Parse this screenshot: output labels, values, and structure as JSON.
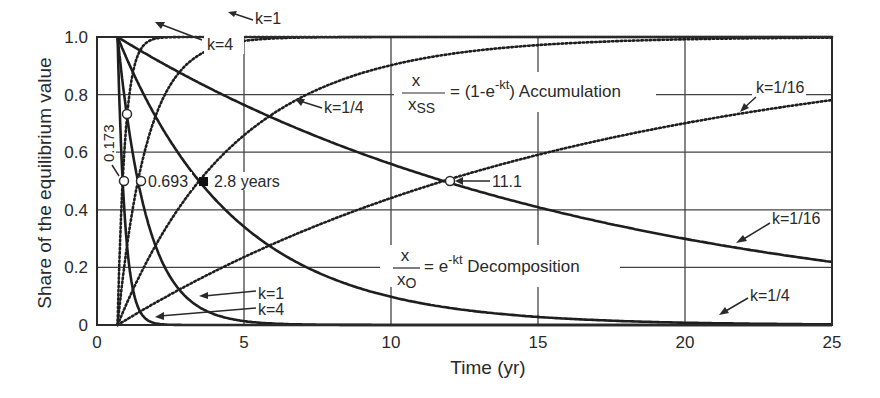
{
  "chart_data": {
    "type": "line",
    "title": "",
    "xlabel": "Time (yr)",
    "ylabel": "Share of the equilibrium value",
    "xlim": [
      0,
      25
    ],
    "ylim": [
      0,
      1.0
    ],
    "x_ticks": [
      "0",
      "5",
      "10",
      "15",
      "20",
      "25"
    ],
    "y_ticks": [
      "0",
      "0.2",
      "0.4",
      "0.6",
      "0.8",
      "1.0"
    ],
    "grid": true,
    "time_offset": 0.7,
    "series": [
      {
        "name": "Decomposition k=4",
        "group": "decomposition",
        "k": 4,
        "style": "solid"
      },
      {
        "name": "Decomposition k=1",
        "group": "decomposition",
        "k": 1,
        "style": "solid"
      },
      {
        "name": "Decomposition k=1/4",
        "group": "decomposition",
        "k": 0.25,
        "style": "solid"
      },
      {
        "name": "Decomposition k=1/16",
        "group": "decomposition",
        "k": 0.0625,
        "style": "solid"
      },
      {
        "name": "Accumulation k=4",
        "group": "accumulation",
        "k": 4,
        "style": "dotted"
      },
      {
        "name": "Accumulation k=1",
        "group": "accumulation",
        "k": 1,
        "style": "dotted"
      },
      {
        "name": "Accumulation k=1/4",
        "group": "accumulation",
        "k": 0.25,
        "style": "dotted"
      },
      {
        "name": "Accumulation k=1/16",
        "group": "accumulation",
        "k": 0.0625,
        "style": "dotted"
      }
    ],
    "half_life_points": [
      {
        "label": "0.173",
        "t": 0.173,
        "y": 0.5
      },
      {
        "label": "0.693",
        "t": 0.693,
        "y": 0.5
      },
      {
        "label": "2.8 years",
        "t": 2.8,
        "y": 0.5,
        "filled": true
      },
      {
        "label": "11.1",
        "t": 11.1,
        "y": 0.5
      }
    ],
    "annotations": {
      "accumulation_formula": {
        "num": "x",
        "den": "x",
        "den_sub": "SS",
        "rhs_pre": "= (1-e",
        "rhs_exp": "-kt",
        "rhs_post": ") Accumulation"
      },
      "decomposition_formula": {
        "num": "x",
        "den": "x",
        "den_sub": "O",
        "rhs_pre": "= e",
        "rhs_exp": "-kt",
        "rhs_post": " Decomposition"
      },
      "labels": [
        {
          "text": "k=1",
          "pos": "top accumulation"
        },
        {
          "text": "k=4",
          "pos": "top accumulation"
        },
        {
          "text": "k=1/4",
          "pos": "accumulation"
        },
        {
          "text": "k=1/16",
          "pos": "accumulation"
        },
        {
          "text": "k=1/16",
          "pos": "decomposition"
        },
        {
          "text": "k=1",
          "pos": "decomposition bottom"
        },
        {
          "text": "k=4",
          "pos": "decomposition bottom"
        },
        {
          "text": "k=1/4",
          "pos": "decomposition bottom right"
        }
      ]
    }
  },
  "labels": {
    "k1_top": "k=1",
    "k4_top": "k=4",
    "k14_acc": "k=1/4",
    "k116_acc": "k=1/16",
    "k116_dec": "k=1/16",
    "k1_dec": "k=1",
    "k4_dec": "k=4",
    "k14_dec": "k=1/4",
    "hl_0173": "0.173",
    "hl_0693": "0.693",
    "hl_28": "2.8 years",
    "hl_111": "11.1",
    "acc_rhs": "= (1-e",
    "acc_exp": "-kt",
    "acc_post": ") Accumulation",
    "dec_rhs": "= e",
    "dec_exp": "-kt",
    "dec_post": " Decomposition",
    "frac_num": "x",
    "frac_den": "x",
    "acc_sub": "SS",
    "dec_sub": "O"
  }
}
